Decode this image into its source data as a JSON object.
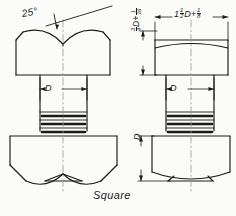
{
  "drawing": {
    "title": "Square bolt head and nut — dimensioned orthographic views",
    "caption": "Square",
    "ink_color": "#1a1a1a",
    "paper_color": "#fbfbf9",
    "views": [
      {
        "name": "across-corners-view",
        "position": "left",
        "description": "Bolt head shown across corners with chamfer arcs meeting at center vee, shank with thread bands, and inverted nut below"
      },
      {
        "name": "across-flats-view",
        "position": "right",
        "description": "Bolt head shown across flats with single shallow chamfer arc, shank with thread bands, and nut below"
      }
    ],
    "annotations": {
      "chamfer_angle": "25",
      "chamfer_angle_unit": "°",
      "chamfer_angle_full": "25°",
      "head_width": {
        "whole": "1",
        "frac_num": "1",
        "frac_den": "2",
        "variable": "D",
        "plus": "+",
        "add_num": "1",
        "add_den": "8",
        "full": "1 1/2 D + 1/8"
      },
      "head_height": {
        "frac_num": "3",
        "frac_den": "4",
        "variable": "D",
        "plus": "+",
        "add_num": "1",
        "add_den": "16",
        "full": "3/4 D + 1/16"
      },
      "shank_diameter_left": "D",
      "shank_diameter_right": "D",
      "nut_height": "D"
    }
  }
}
